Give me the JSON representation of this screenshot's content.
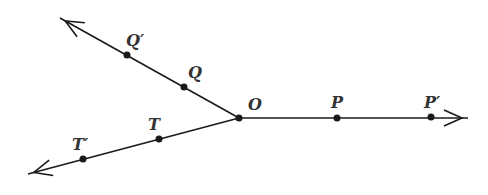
{
  "diagram": {
    "origin": {
      "label": "O",
      "x": 239,
      "y": 118,
      "label_x": 248,
      "label_y": 110
    },
    "rays": [
      {
        "name": "ray-OP",
        "end_x": 468,
        "end_y": 118,
        "arrow": true
      },
      {
        "name": "ray-OQ",
        "end_x": 60,
        "end_y": 18,
        "arrow": true
      },
      {
        "name": "ray-OT",
        "end_x": 28,
        "end_y": 174,
        "arrow": true
      }
    ],
    "points": [
      {
        "label": "P",
        "x": 337,
        "y": 118,
        "label_x": 331,
        "label_y": 108
      },
      {
        "label": "P′",
        "x": 431,
        "y": 117,
        "label_x": 424,
        "label_y": 108
      },
      {
        "label": "Q",
        "x": 184,
        "y": 87,
        "label_x": 188,
        "label_y": 78
      },
      {
        "label": "Q′",
        "x": 127,
        "y": 55,
        "label_x": 126,
        "label_y": 46
      },
      {
        "label": "T",
        "x": 159,
        "y": 139,
        "label_x": 148,
        "label_y": 130
      },
      {
        "label": "T′",
        "x": 83,
        "y": 159,
        "label_x": 72,
        "label_y": 150
      }
    ],
    "stroke_color": "#1a1a1a",
    "label_color": "#333333"
  }
}
